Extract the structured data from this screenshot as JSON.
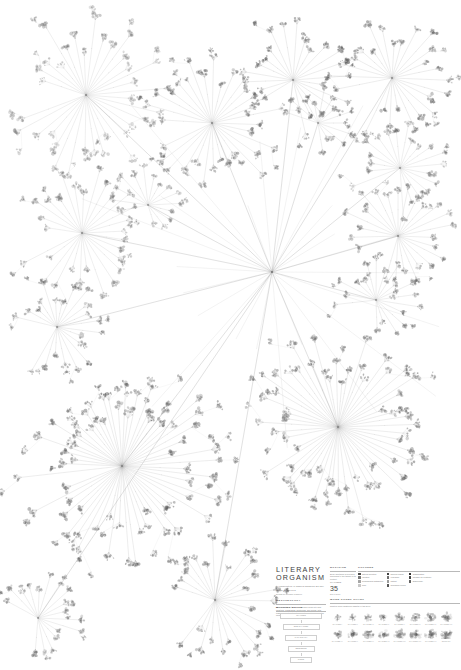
{
  "poster": {
    "title_line1": "LITERARY",
    "title_line2": "ORGANISM",
    "subtitle": "A Visualization of Charles Darwin's On The Origin Of Species",
    "byline": "Design by Stefanie Posavec",
    "background": "#ffffff",
    "ink": "#4a4a4a"
  },
  "sections": {
    "method_heading": "METHODOLOGY",
    "method_body": "Each chapter of the book is broken down into sub-chapters, paragraphs, sentences, and words, with each level of the structure radiating outward from the centre.",
    "notation_heading": "NOTATION",
    "notation_body": "Every sentence is coloured according to the theme of its content.",
    "colors_heading": "COLOURS",
    "stat_label": "CHAPTERS",
    "stat_value": "35",
    "stat_caption": "EDITIONS",
    "scale_heading": "MAPPING SCALE",
    "wordcount_heading": "WORD COUNT CHART",
    "wordcount_body": "Relative word length per chapter of the book."
  },
  "legend_colors": [
    {
      "label": "Natural selection",
      "color": "#4e4e4e"
    },
    {
      "label": "Variation",
      "color": "#7a7a7a"
    },
    {
      "label": "Geographical distribution",
      "color": "#a6a6a6"
    },
    {
      "label": "Time",
      "color": "#c8c8c8"
    },
    {
      "label": "Species origins",
      "color": "#3c3c3c"
    },
    {
      "label": "Hybridism",
      "color": "#6e6e6e"
    },
    {
      "label": "Instinct",
      "color": "#9c9c9c"
    },
    {
      "label": "Geological record",
      "color": "#555555"
    },
    {
      "label": "Classification",
      "color": "#2f2f2f"
    },
    {
      "label": "Struggle for existence",
      "color": "#464646"
    },
    {
      "label": "Embryology",
      "color": "#636363"
    }
  ],
  "scale_levels": [
    {
      "label": "CHAPTER"
    },
    {
      "label": "SUB-CHAPTER"
    },
    {
      "label": "PARAGRAPH"
    },
    {
      "label": "SENTENCE"
    },
    {
      "label": "WORD"
    }
  ],
  "wordcount_chart": {
    "row1": [
      {
        "label": "CHAPTER I",
        "value": 38
      },
      {
        "label": "CHAPTER II",
        "value": 46
      },
      {
        "label": "CHAPTER III",
        "value": 52
      },
      {
        "label": "CHAPTER IV",
        "value": 61
      },
      {
        "label": "CHAPTER V",
        "value": 70
      },
      {
        "label": "CHAPTER VI",
        "value": 76
      },
      {
        "label": "CHAPTER VII",
        "value": 83
      },
      {
        "label": "CHAPTER VIII",
        "value": 88
      }
    ],
    "row2": [
      {
        "label": "CHAPTER IX",
        "value": 64
      },
      {
        "label": "CHAPTER X",
        "value": 72
      },
      {
        "label": "CHAPTER XI",
        "value": 80
      },
      {
        "label": "CHAPTER XII",
        "value": 86
      },
      {
        "label": "CHAPTER XIII",
        "value": 92
      },
      {
        "label": "CHAPTER XIV",
        "value": 96
      },
      {
        "label": "CHAPTER XV",
        "value": 99
      },
      {
        "label": "SUMMARY",
        "value": 100
      }
    ]
  },
  "chart_data": {
    "type": "diagram",
    "subtype": "radial-tree",
    "title": "Literary Organism",
    "root": {
      "x": 272,
      "y": 272
    },
    "canvas": {
      "width": 461,
      "height": 670
    },
    "hubs": [
      {
        "id": "ch1",
        "x": 86,
        "y": 95,
        "r": 72,
        "spokes": 34,
        "angle0": 200,
        "sweep": 330,
        "tone": 0.3,
        "tuft": 5.4,
        "seed": 11
      },
      {
        "id": "ch2",
        "x": 212,
        "y": 123,
        "r": 66,
        "spokes": 31,
        "angle0": 185,
        "sweep": 340,
        "tone": 0.46,
        "tuft": 5.0,
        "seed": 23
      },
      {
        "id": "ch3",
        "x": 293,
        "y": 80,
        "r": 52,
        "spokes": 22,
        "angle0": 150,
        "sweep": 300,
        "tone": 0.55,
        "tuft": 4.6,
        "seed": 37
      },
      {
        "id": "ch4",
        "x": 392,
        "y": 78,
        "r": 56,
        "spokes": 25,
        "angle0": 170,
        "sweep": 320,
        "tone": 0.5,
        "tuft": 4.8,
        "seed": 49
      },
      {
        "id": "ch5",
        "x": 318,
        "y": 123,
        "r": 30,
        "spokes": 13,
        "angle0": 200,
        "sweep": 260,
        "tone": 0.42,
        "tuft": 3.8,
        "seed": 57
      },
      {
        "id": "ch6",
        "x": 400,
        "y": 168,
        "r": 44,
        "spokes": 20,
        "angle0": 160,
        "sweep": 300,
        "tone": 0.34,
        "tuft": 4.2,
        "seed": 63
      },
      {
        "id": "ch7",
        "x": 82,
        "y": 233,
        "r": 58,
        "spokes": 28,
        "angle0": 190,
        "sweep": 335,
        "tone": 0.36,
        "tuft": 4.7,
        "seed": 71
      },
      {
        "id": "ch8",
        "x": 148,
        "y": 205,
        "r": 34,
        "spokes": 15,
        "angle0": 170,
        "sweep": 280,
        "tone": 0.3,
        "tuft": 3.9,
        "seed": 83
      },
      {
        "id": "ch9",
        "x": 398,
        "y": 236,
        "r": 50,
        "spokes": 24,
        "angle0": 165,
        "sweep": 315,
        "tone": 0.4,
        "tuft": 4.5,
        "seed": 91
      },
      {
        "id": "ch10",
        "x": 57,
        "y": 327,
        "r": 46,
        "spokes": 21,
        "angle0": 195,
        "sweep": 300,
        "tone": 0.45,
        "tuft": 4.4,
        "seed": 103
      },
      {
        "id": "ch11",
        "x": 376,
        "y": 300,
        "r": 40,
        "spokes": 18,
        "angle0": 175,
        "sweep": 290,
        "tone": 0.44,
        "tuft": 4.1,
        "seed": 113
      },
      {
        "id": "ch12",
        "x": 122,
        "y": 466,
        "r": 92,
        "spokes": 58,
        "angle0": 175,
        "sweep": 350,
        "tone": 0.52,
        "tuft": 5.8,
        "seed": 127
      },
      {
        "id": "ch13",
        "x": 338,
        "y": 427,
        "r": 86,
        "spokes": 54,
        "angle0": 170,
        "sweep": 350,
        "tone": 0.5,
        "tuft": 5.6,
        "seed": 139
      },
      {
        "id": "ch14",
        "x": 215,
        "y": 600,
        "r": 56,
        "spokes": 26,
        "angle0": 200,
        "sweep": 300,
        "tone": 0.48,
        "tuft": 4.8,
        "seed": 151
      },
      {
        "id": "ch15",
        "x": 38,
        "y": 618,
        "r": 40,
        "spokes": 17,
        "angle0": 210,
        "sweep": 260,
        "tone": 0.38,
        "tuft": 4.2,
        "seed": 163
      }
    ]
  }
}
